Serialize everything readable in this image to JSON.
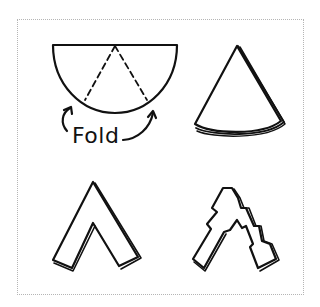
{
  "diagram": {
    "steps": [
      {
        "id": 1,
        "name": "semicircle",
        "label": "Fold",
        "description": "Semicircle with two dashed fold lines meeting at top center; curved arrows indicate folding inward"
      },
      {
        "id": 2,
        "name": "folded-cone",
        "description": "Folded wedge/cone shape with layered edges"
      },
      {
        "id": 3,
        "name": "cut-chevron",
        "description": "Folded cone with a triangular section cut out, forming an A/chevron shape"
      },
      {
        "id": 4,
        "name": "cut-zigzag",
        "description": "Chevron shape with zigzag notches cut along edges"
      }
    ],
    "colors": {
      "stroke": "#111111",
      "frame": "#b5b5b5",
      "background": "#ffffff"
    }
  }
}
